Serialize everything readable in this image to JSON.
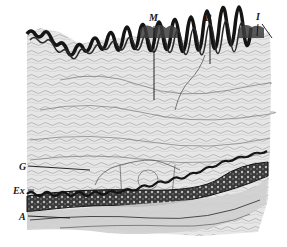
{
  "figure": {
    "labels": {
      "M": "M",
      "R": "R",
      "I": "I",
      "G": "G",
      "Ex": "Ex",
      "A": "A"
    },
    "colors": {
      "background": "#ffffff",
      "tissue": "#e4e4e4",
      "tissue_dark": "#bdbdbd",
      "elastic_band": "#141414",
      "fiber": "#6a6a6a"
    }
  }
}
